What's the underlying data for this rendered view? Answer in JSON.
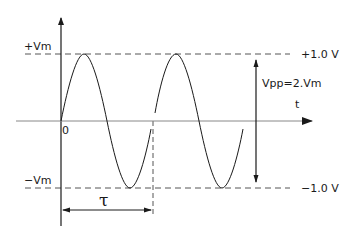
{
  "diagram": {
    "type": "sine-waveform",
    "labels": {
      "plus_vm": "+Vm",
      "minus_vm": "−Vm",
      "plus_1v": "+1.0 V",
      "minus_1v": "−1.0 V",
      "vpp": "Vpp=2.Vm",
      "time_axis": "t",
      "origin": "0",
      "period": "τ"
    },
    "colors": {
      "line": "#1a1a1a",
      "dashed": "#555555",
      "background": "#ffffff"
    }
  }
}
